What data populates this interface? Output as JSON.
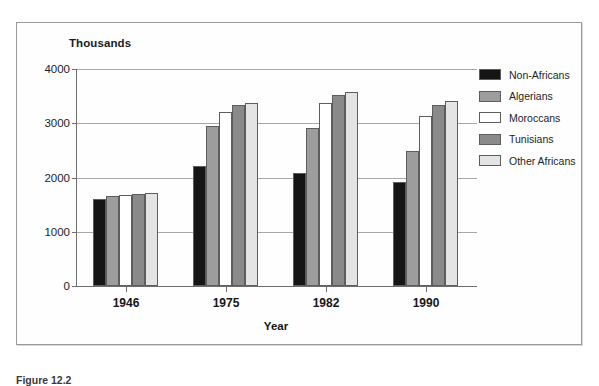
{
  "figure": {
    "units_label": "Thousands",
    "caption": "Figure 12.2"
  },
  "chart_data": {
    "type": "bar",
    "title": "",
    "subtitle": "",
    "xlabel": "Year",
    "ylabel": "Thousands",
    "categories": [
      "1946",
      "1975",
      "1982",
      "1990"
    ],
    "ylim": [
      0,
      4000
    ],
    "yticks": [
      0,
      1000,
      2000,
      3000,
      4000
    ],
    "ytick_labels": [
      "0",
      "1000",
      "2000",
      "3000",
      "4000"
    ],
    "grid": true,
    "legend_position": "right",
    "series": [
      {
        "name": "Non-Africans",
        "color": "#151515",
        "values": [
          1610,
          2220,
          2080,
          1925
        ]
      },
      {
        "name": "Algerians",
        "color": "#9d9d9d",
        "values": [
          1655,
          2950,
          2910,
          2490
        ]
      },
      {
        "name": "Moroccans",
        "color": "#ffffff",
        "values": [
          1670,
          3215,
          3370,
          3140
        ]
      },
      {
        "name": "Tunisians",
        "color": "#8a8a8a",
        "values": [
          1700,
          3340,
          3530,
          3340
        ]
      },
      {
        "name": "Other Africans",
        "color": "#e4e4e4",
        "values": [
          1710,
          3375,
          3585,
          3415
        ]
      }
    ]
  }
}
